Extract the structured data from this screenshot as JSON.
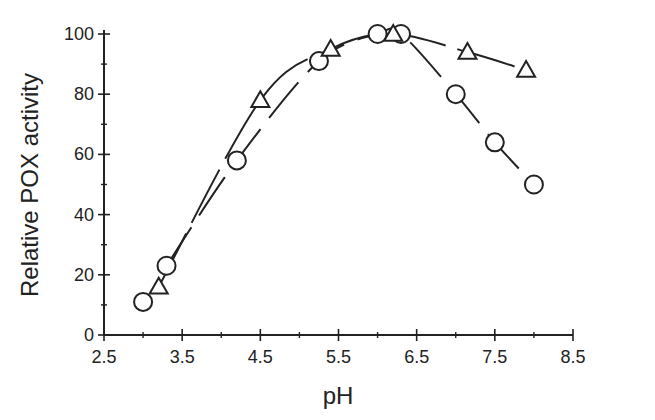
{
  "chart_data": {
    "type": "line",
    "title": "",
    "xlabel": "pH",
    "ylabel": "Relative POX activity",
    "xlim": [
      2.5,
      8.5
    ],
    "ylim": [
      0,
      100
    ],
    "x_ticks": [
      "2.5",
      "3.5",
      "4.5",
      "5.5",
      "6.5",
      "7.5",
      "8.5"
    ],
    "y_ticks": [
      "0",
      "20",
      "40",
      "60",
      "80",
      "100"
    ],
    "grid": false,
    "legend": null,
    "series": [
      {
        "name": "circles",
        "marker": "circle",
        "line": "dashed",
        "x": [
          3.0,
          3.3,
          4.2,
          5.25,
          6.0,
          6.3,
          7.0,
          7.5,
          8.0
        ],
        "y": [
          11,
          23,
          58,
          91,
          100,
          100,
          80,
          64,
          50
        ]
      },
      {
        "name": "triangles",
        "marker": "triangle",
        "line": "dashed",
        "x": [
          3.2,
          4.5,
          5.4,
          6.2,
          7.15,
          7.9
        ],
        "y": [
          16,
          78,
          95,
          100,
          94,
          88
        ]
      }
    ]
  },
  "colors": {
    "ink": "#222222",
    "background": "#ffffff"
  }
}
